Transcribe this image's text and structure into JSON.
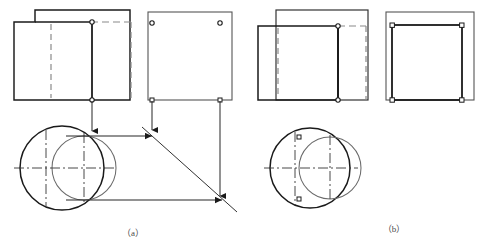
{
  "figure": {
    "background_color": "#ffffff",
    "line_color": "#1a1a1a",
    "thin_line_color": "#555555",
    "dashed_line_color": "#888888",
    "center_line_color": "#333333",
    "caption_color": "#4a4a4a",
    "width": 481,
    "height": 249
  },
  "captions": {
    "left": "（a）",
    "right": "（b）"
  },
  "panels": [
    {
      "id": "panel-a",
      "caption": "（a）",
      "views": [
        {
          "id": "a-front-view",
          "name": "front-view",
          "description": "Stepped outline of two overlapping rectangles with hidden (dashed) edges of the smaller cylinder",
          "x": 14,
          "y": 10,
          "width": 116,
          "height": 90
        },
        {
          "id": "a-side-view",
          "name": "side-view",
          "description": "Plain rectangle with two projector end points marked by small circles",
          "x": 148,
          "y": 12,
          "width": 84,
          "height": 88
        },
        {
          "id": "a-top-view",
          "name": "top-view",
          "description": "Two overlapping circles with centre lines representing the two cylinder axes",
          "cx_left": 62,
          "cy": 168,
          "r_left": 42,
          "cx_right": 84,
          "r_right": 32
        }
      ],
      "construction": {
        "miter_line_angle_deg": 45,
        "projector_count": 6,
        "arrow_count": 6,
        "description": "45° miter line transfers depth from the top view to the side view"
      }
    },
    {
      "id": "panel-b",
      "caption": "（b）",
      "views": [
        {
          "id": "b-front-view",
          "name": "front-view",
          "description": "Two overlapping rectangles; the smaller (front) cylinder drawn bold with hidden dashed edges behind",
          "x": 258,
          "y": 10,
          "width": 110,
          "height": 90
        },
        {
          "id": "b-side-view",
          "name": "side-view",
          "description": "Outer thin rectangle with bold inner rectangle marked at the four corners",
          "x": 386,
          "y": 12,
          "width": 88,
          "height": 88
        },
        {
          "id": "b-top-view",
          "name": "top-view",
          "description": "Two overlapping circles of equal weight with centre lines and intersection points marked",
          "cx_left": 310,
          "cy": 168,
          "r_left": 40,
          "cx_right": 330,
          "r_right": 31
        }
      ],
      "construction": {
        "miter_line_angle_deg": 0,
        "projector_count": 0,
        "arrow_count": 0,
        "description": "No miter-line construction shown; result views only"
      }
    }
  ],
  "markers": {
    "node_symbol": "small open circle",
    "node_radius_px": 2.2,
    "square_node_symbol": "small open square",
    "count_panel_a": 6,
    "count_panel_b": 10
  },
  "line_styles": {
    "visible": "solid thick",
    "hidden": "dashed",
    "centre": "dash-dot",
    "projector": "thin solid with arrowhead",
    "miter": "thin solid at 45 degrees"
  }
}
